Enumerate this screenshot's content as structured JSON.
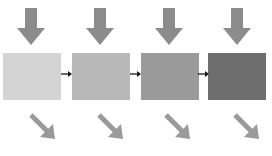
{
  "diagram": {
    "type": "flow",
    "stages": [
      {
        "id": 1,
        "fill": "#d4d4d4",
        "left": 3
      },
      {
        "id": 2,
        "fill": "#b8b8b8",
        "left": 72
      },
      {
        "id": 3,
        "fill": "#9a9a9a",
        "left": 141
      },
      {
        "id": 4,
        "fill": "#6e6e6e",
        "left": 208
      }
    ],
    "input_arrow_color": "#8c8c8c",
    "output_arrow_color": "#9a9a9a",
    "connector_color": "#1a1a1a",
    "connectors": 3
  }
}
